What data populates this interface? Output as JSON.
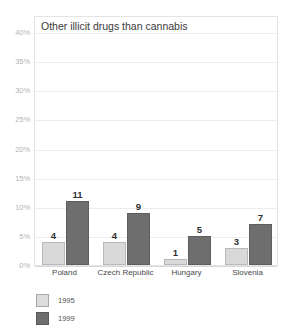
{
  "chart_data": {
    "type": "bar",
    "title": "Other illicit drugs than cannabis",
    "xlabel": "",
    "ylabel": "",
    "ylim": [
      0,
      40
    ],
    "ytick_step": 5,
    "ytick_labels": [
      "0%",
      "5%",
      "10%",
      "15%",
      "20%",
      "25%",
      "30%",
      "35%",
      "40%"
    ],
    "ytick_values": [
      0,
      5,
      10,
      15,
      20,
      25,
      30,
      35,
      40
    ],
    "grid": true,
    "legend_position": "below-left",
    "categories": [
      "Poland",
      "Czech Republic",
      "Hungary",
      "Slovenia"
    ],
    "series": [
      {
        "name": "1995",
        "color": "#d9d9d9",
        "values": [
          4,
          4,
          1,
          3
        ],
        "labels": [
          "4",
          "4",
          "1",
          "3"
        ]
      },
      {
        "name": "1999",
        "color": "#6e6e6e",
        "values": [
          11,
          9,
          5,
          7
        ],
        "labels": [
          "11",
          "9",
          "5",
          "7"
        ]
      }
    ],
    "value_labels_shown": true
  },
  "colors": {
    "series_1995": "#d9d9d9",
    "series_1999": "#6e6e6e",
    "gridline": "#ededed",
    "plot_border": "#e4e4e4",
    "tick_text": "#b4b4b4",
    "title_text": "#3a3a3a",
    "category_text": "#4a4a4a",
    "background": "#ffffff"
  }
}
